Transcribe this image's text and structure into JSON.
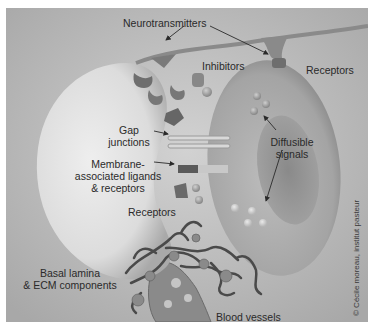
{
  "figure": {
    "labels": {
      "neurotransmitters": "Neurotransmitters",
      "inhibitors": "Inhibitors",
      "receptors_top": "Receptors",
      "gap_line1": "Gap",
      "gap_line2": "junctions",
      "diffusible_line1": "Diffusible",
      "diffusible_line2": "signals",
      "membrane_line1": "Membrane-",
      "membrane_line2": "associated ligands",
      "membrane_line3": "& receptors",
      "receptors_bottom": "Receptors",
      "basal_line1": "Basal lamina",
      "basal_line2": "& ECM components",
      "blood_vessels": "Blood vessels"
    },
    "credit": "© Cécile moreau, institut pasteur",
    "colors": {
      "background": "#b9b9b9",
      "left_cell": "#dedede",
      "right_cell": "#a9a9a9",
      "nucleus": "#8e8e8e",
      "vessels": "#4a4a4a",
      "text": "#2a2a2a"
    }
  }
}
